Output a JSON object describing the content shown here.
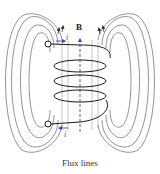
{
  "figure": {
    "caption": "Flux lines",
    "field_label": "B",
    "current_label_top": "i",
    "current_label_bottom": "i",
    "colors": {
      "flux_line": "#555555",
      "coil": "#1a1a1a",
      "axis": "#3b4fa8",
      "current_arrow": "#3b4fa8"
    },
    "coil_turns": 4,
    "flux_loops_per_side": 4
  }
}
